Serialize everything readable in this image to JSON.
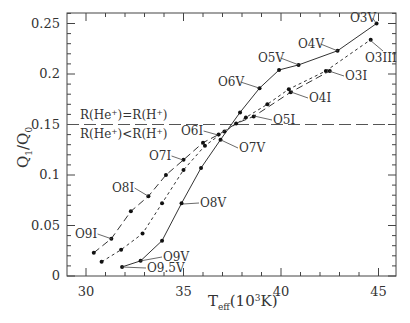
{
  "chart_data": {
    "type": "line",
    "title": "",
    "xlabel": "T_eff(10^3K)",
    "ylabel": "Q_1/Q_0",
    "xlim": [
      29,
      46
    ],
    "ylim": [
      0,
      0.26
    ],
    "xticks": [
      30,
      35,
      40,
      45
    ],
    "yticks": [
      0,
      0.05,
      0.1,
      0.15,
      0.2,
      0.25
    ],
    "xtick_labels": [
      "30",
      "35",
      "40",
      "45"
    ],
    "ytick_labels": [
      "0",
      "0.05",
      "0.1",
      "0.15",
      "0.2",
      "0.25"
    ],
    "grid": false,
    "reference_line": {
      "y": 0.15,
      "style": "long-dash",
      "label_above": "R(He+)=R(H+)",
      "label_below": "R(He+)<R(H+)"
    },
    "series": [
      {
        "name": "Dwarfs (V)",
        "style": "solid",
        "points": [
          {
            "x": 31.85,
            "y": 0.009,
            "label": "O9.5V"
          },
          {
            "x": 32.8,
            "y": 0.015,
            "label": "O9V"
          },
          {
            "x": 33.9,
            "y": 0.035
          },
          {
            "x": 34.9,
            "y": 0.072,
            "label": "O8V"
          },
          {
            "x": 35.9,
            "y": 0.107
          },
          {
            "x": 36.9,
            "y": 0.135,
            "label": "O7V"
          },
          {
            "x": 37.9,
            "y": 0.162
          },
          {
            "x": 38.9,
            "y": 0.186,
            "label": "O6V"
          },
          {
            "x": 39.9,
            "y": 0.204
          },
          {
            "x": 40.9,
            "y": 0.209,
            "label": "O5V"
          },
          {
            "x": 42.9,
            "y": 0.223,
            "label": "O4V"
          },
          {
            "x": 44.9,
            "y": 0.25,
            "label": "O3V"
          }
        ]
      },
      {
        "name": "Giants (III)",
        "style": "short-dash",
        "points": [
          {
            "x": 30.8,
            "y": 0.014
          },
          {
            "x": 31.8,
            "y": 0.026
          },
          {
            "x": 32.9,
            "y": 0.042
          },
          {
            "x": 33.9,
            "y": 0.072
          },
          {
            "x": 35.0,
            "y": 0.105
          },
          {
            "x": 36.1,
            "y": 0.129
          },
          {
            "x": 37.1,
            "y": 0.143
          },
          {
            "x": 38.2,
            "y": 0.157
          },
          {
            "x": 39.3,
            "y": 0.17
          },
          {
            "x": 40.4,
            "y": 0.185
          },
          {
            "x": 42.3,
            "y": 0.203
          },
          {
            "x": 44.6,
            "y": 0.234,
            "label": "O3III"
          }
        ]
      },
      {
        "name": "Supergiants (I)",
        "style": "long-dash",
        "points": [
          {
            "x": 30.4,
            "y": 0.023
          },
          {
            "x": 31.3,
            "y": 0.037,
            "label": "O9I"
          },
          {
            "x": 32.3,
            "y": 0.064
          },
          {
            "x": 33.2,
            "y": 0.079,
            "label": "O8I"
          },
          {
            "x": 34.1,
            "y": 0.1
          },
          {
            "x": 35.0,
            "y": 0.115,
            "label": "O7I"
          },
          {
            "x": 36.0,
            "y": 0.132
          },
          {
            "x": 36.8,
            "y": 0.14,
            "label": "O6I"
          },
          {
            "x": 37.7,
            "y": 0.151
          },
          {
            "x": 38.6,
            "y": 0.158,
            "label": "O5I"
          },
          {
            "x": 40.5,
            "y": 0.182,
            "label": "O4I"
          },
          {
            "x": 42.5,
            "y": 0.203,
            "label": "O3I"
          }
        ]
      }
    ],
    "annotations": [
      {
        "text": "O3V",
        "x": 350,
        "y": 22,
        "anchor_x": 376,
        "anchor_y": 23
      },
      {
        "text": "O4V",
        "x": 298,
        "y": 48,
        "anchor_x": 338,
        "anchor_y": 51
      },
      {
        "text": "O5V",
        "x": 258,
        "y": 62,
        "anchor_x": 299,
        "anchor_y": 65
      },
      {
        "text": "O6V",
        "x": 218,
        "y": 86,
        "anchor_x": 259,
        "anchor_y": 88
      },
      {
        "text": "O3III",
        "x": 365,
        "y": 62,
        "anchor_x": 370,
        "anchor_y": 40
      },
      {
        "text": "O3I",
        "x": 345,
        "y": 80,
        "anchor_x": 329,
        "anchor_y": 71
      },
      {
        "text": "O4I",
        "x": 309,
        "y": 102,
        "anchor_x": 291,
        "anchor_y": 92
      },
      {
        "text": "O5I",
        "x": 273,
        "y": 124,
        "anchor_x": 254,
        "anchor_y": 116
      },
      {
        "text": "O6I",
        "x": 181,
        "y": 135,
        "anchor_x": 218,
        "anchor_y": 135
      },
      {
        "text": "O7I",
        "x": 149,
        "y": 160,
        "anchor_x": 183,
        "anchor_y": 160
      },
      {
        "text": "O7V",
        "x": 239,
        "y": 152,
        "anchor_x": 221,
        "anchor_y": 140
      },
      {
        "text": "O8I",
        "x": 112,
        "y": 192,
        "anchor_x": 148,
        "anchor_y": 196
      },
      {
        "text": "O8V",
        "x": 200,
        "y": 207,
        "anchor_x": 183,
        "anchor_y": 204
      },
      {
        "text": "O9I",
        "x": 75,
        "y": 238,
        "anchor_x": 112,
        "anchor_y": 239
      },
      {
        "text": "O9V",
        "x": 163,
        "y": 261,
        "anchor_x": 140,
        "anchor_y": 261
      },
      {
        "text": "O9.5V",
        "x": 147,
        "y": 272,
        "anchor_x": 122,
        "anchor_y": 267
      }
    ]
  },
  "axes": {
    "xlabel_main": "T",
    "xlabel_sub": "eff",
    "xlabel_rest": "(10",
    "xlabel_sup": "3",
    "xlabel_end": "K)",
    "ylabel_Q": "Q",
    "ylabel_sub1": "1",
    "ylabel_slash": "/Q",
    "ylabel_sub0": "0"
  },
  "reference_labels": {
    "above": "R(He⁺)=R(H⁺)",
    "below": "R(He⁺)<R(H⁺)"
  }
}
